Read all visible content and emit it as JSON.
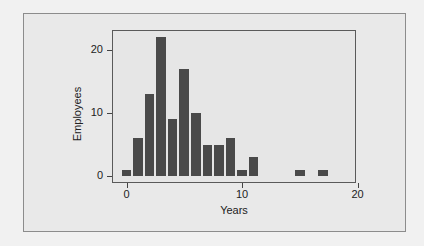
{
  "chart_data": {
    "type": "bar",
    "subtype": "histogram",
    "title": "",
    "xlabel": "Years",
    "ylabel": "Employees",
    "x": [
      0,
      1,
      2,
      3,
      4,
      5,
      6,
      7,
      8,
      9,
      10,
      11,
      12,
      13,
      14,
      15,
      16,
      17
    ],
    "values": [
      1,
      6,
      13,
      22,
      9,
      17,
      10,
      5,
      5,
      6,
      1,
      3,
      0,
      0,
      0,
      1,
      0,
      1
    ],
    "xticks": [
      "0",
      "10",
      "20"
    ],
    "yticks": [
      "0",
      "10",
      "20"
    ],
    "xlim": [
      -1.2,
      20
    ],
    "ylim": [
      -1,
      23
    ],
    "grid": false,
    "legend": null,
    "bar_color": "#4a4a4a",
    "background_color": "#e6e6e6"
  }
}
